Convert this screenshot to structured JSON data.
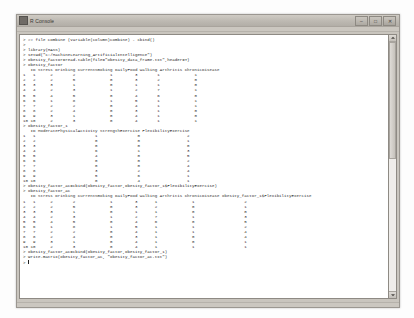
{
  "window": {
    "title": "R Console",
    "app_icon": "r-logo-icon",
    "buttons": [
      {
        "name": "minimize-button",
        "glyph": "–"
      },
      {
        "name": "maximize-button",
        "glyph": "□"
      },
      {
        "name": "close-button",
        "glyph": "✕"
      }
    ]
  },
  "scrollbar": {
    "up_arrow": "scroll-up-arrow-icon",
    "down_arrow": "scroll-down-arrow-icon",
    "thumb": "scrollbar-thumb"
  },
  "console": {
    "prompt": ">",
    "lines": [
      "> ## file combine (variable(column)combine) - cbind()",
      ">",
      "> library(MASS)",
      "> setwd(\"c:/MachineLearning_ArtificialIntelligence\")",
      "> obesity_factor=read.table(file=\"obesity_data_frame.txt\",header=T)",
      "> obesity_factor",
      "   ID Stress Drinking CurrentSmoking DailyFood Walking Arthritis ChronicDisease",
      "1   1      2        2              1         3        1              1",
      "2   2      2        5              0         3        2              0",
      "3   3      3        1              0         1        1              0",
      "4   4      2        3              1         2        7              1",
      "5   5      4        5              0         4        6              0",
      "6   6      1        8              1         5        1              1",
      "7   7      2        2              0         4        1              1",
      "8   8      2        4              0         3        1              0",
      "9   9      3        1              0         4        1              0",
      "10 10      2        3              0         4        1              1",
      "> obesity_factor_1",
      "   ID ModeratePhysicalActivity StrengthExercise FlexibilityExercise",
      "1   1                        1                0                   2",
      "2   2                        0                0                   1",
      "3   3                        0                0                   0",
      "4   4                        6                1                   3",
      "5   5                        4                0                   5",
      "6   6                        0                0                   2",
      "7   7                        0                0                   4",
      "8   8                        3                2                   4",
      "9   9                        5                6                   1",
      "10 10                        0                4                   1",
      "> obesity_factor_ac=cbind(obesity_factor,obesity_factor_1$FlexibilityExercise)",
      "> obesity_factor_ac",
      "   ID Stress Drinking CurrentSmoking DailyFood Walking Arthritis ChronicDisease obesity_factor_1$FlexibilityExercise",
      "1   1      2        2              1         3       1              1                    2",
      "2   2      2        5              0         3       2              0                    1",
      "3   3      3        1              0         1       1              0                    0",
      "4   4      2        3              1         2       7              1                    3",
      "5   5      4        5              0         4       6              0                    5",
      "6   6      1        8              1         5       1              1                    2",
      "7   7      2        2              0         4       1              1                    4",
      "8   8      2        4              0         3       1              0                    4",
      "9   9      3        1              0         4       1              0                    1",
      "10 10      2        3              0         4       1              1                    1",
      "> obesity_factor_ac=cbind(obesity_factor,obesity_factor_1)",
      "> write.matrix(obesity_factor_ac, \"obesity_factor_ac.txt\")",
      ">"
    ]
  }
}
